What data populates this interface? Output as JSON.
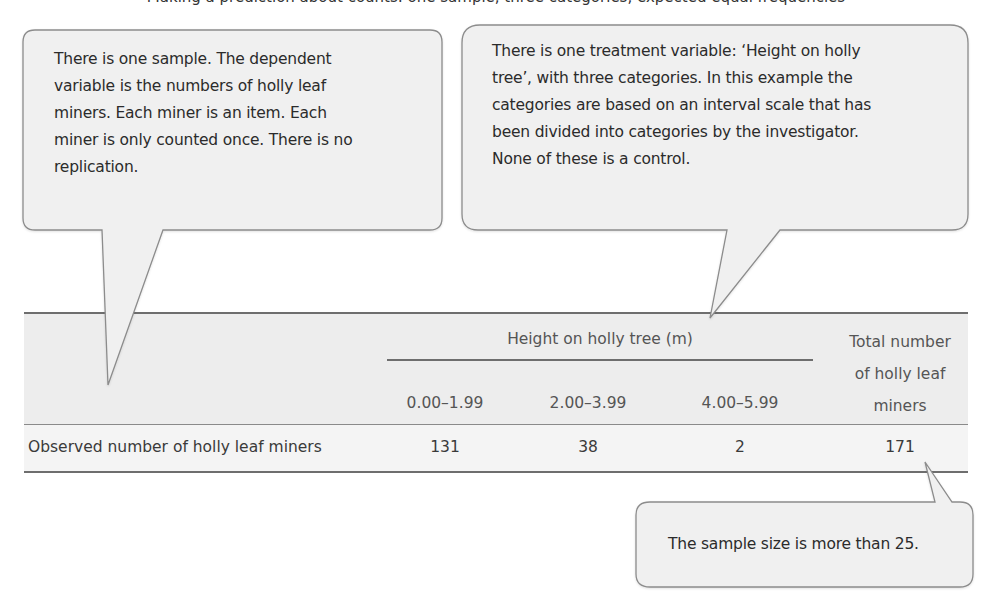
{
  "top_cut_text": "Making a prediction about counts: one sample, three categories, expected equal frequencies",
  "callouts": {
    "sample": {
      "lines": [
        "There is one sample. The dependent",
        "variable is the numbers of holly leaf",
        "miners.  Each miner is an item.  Each",
        "miner is only counted once.  There is no",
        "replication."
      ]
    },
    "treatment": {
      "lines": [
        "There is one treatment variable:  ‘Height on holly",
        "tree’, with three categories. In this example the",
        "categories are based on an interval scale that has",
        "been divided into categories by the investigator.",
        "None of these is a control."
      ]
    },
    "sample_size": {
      "text": "The sample size is more than 25."
    }
  },
  "table": {
    "group_header": "Height on holly tree (m)",
    "columns": [
      "0.00–1.99",
      "2.00–3.99",
      "4.00–5.99"
    ],
    "total_header_lines": [
      "Total number",
      "of holly leaf",
      "miners"
    ],
    "rows": [
      {
        "label": "Observed number of holly leaf miners",
        "values": [
          "131",
          "38",
          "2"
        ],
        "total": "171"
      }
    ]
  },
  "colors": {
    "bubble_fill": "#f0f0f0",
    "bubble_stroke": "#8c8c8c",
    "header_band": "#ededed",
    "rule": "#6e6e6e"
  }
}
